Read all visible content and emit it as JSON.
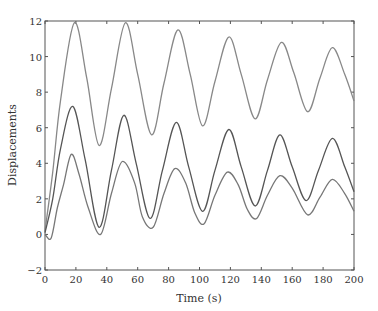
{
  "chart_data": {
    "type": "line",
    "title": "",
    "xlabel": "Time (s)",
    "ylabel": "Displacements",
    "xlim": [
      0,
      200
    ],
    "ylim": [
      -2,
      12
    ],
    "xticks": [
      0,
      20,
      40,
      60,
      80,
      100,
      120,
      140,
      160,
      180,
      200
    ],
    "yticks": [
      -2,
      0,
      2,
      4,
      6,
      8,
      10,
      12
    ],
    "xtick_labels": [
      "0",
      "20",
      "40",
      "60",
      "80",
      "100",
      "120",
      "140",
      "160",
      "180",
      "200"
    ],
    "ytick_labels": [
      "−2",
      "0",
      "2",
      "4",
      "6",
      "8",
      "10",
      "12"
    ],
    "grid": false,
    "legend": "none",
    "series": [
      {
        "name": "upper",
        "color": "#888888",
        "x": [
          0,
          5,
          10,
          19,
          27,
          35,
          43,
          52,
          60,
          69,
          77,
          86,
          94,
          102,
          110,
          119,
          127,
          136,
          144,
          153,
          161,
          170,
          178,
          186,
          194,
          200
        ],
        "y": [
          0.2,
          3.5,
          7.5,
          11.9,
          8.8,
          5.0,
          8.2,
          11.9,
          9.0,
          5.6,
          8.5,
          11.5,
          9.0,
          6.1,
          8.6,
          11.1,
          9.0,
          6.5,
          8.7,
          10.8,
          9.1,
          6.9,
          8.8,
          10.5,
          9.0,
          7.5
        ]
      },
      {
        "name": "middle",
        "color": "#555555",
        "x": [
          0,
          5,
          10,
          18,
          26,
          35,
          43,
          51,
          59,
          68,
          76,
          85,
          93,
          102,
          110,
          119,
          127,
          136,
          144,
          152,
          160,
          169,
          177,
          186,
          194,
          200
        ],
        "y": [
          0.1,
          2.0,
          4.8,
          7.2,
          4.2,
          0.4,
          3.6,
          6.7,
          4.0,
          0.9,
          3.6,
          6.3,
          3.8,
          1.3,
          3.6,
          5.9,
          3.8,
          1.6,
          3.6,
          5.6,
          3.8,
          1.9,
          3.6,
          5.4,
          3.8,
          2.4
        ]
      },
      {
        "name": "lower",
        "color": "#777777",
        "x": [
          0,
          4,
          8,
          12,
          17,
          22,
          28,
          36,
          43,
          50,
          58,
          63,
          70,
          77,
          84,
          91,
          97,
          103,
          110,
          118,
          125,
          131,
          137,
          144,
          152,
          160,
          170,
          178,
          186,
          194,
          200
        ],
        "y": [
          0.0,
          -0.2,
          1.5,
          2.8,
          4.5,
          3.4,
          1.5,
          0.0,
          2.3,
          4.1,
          2.9,
          1.0,
          0.4,
          2.3,
          3.7,
          2.9,
          1.2,
          0.6,
          2.2,
          3.5,
          2.8,
          1.4,
          0.9,
          2.2,
          3.3,
          2.6,
          1.1,
          2.1,
          3.1,
          2.3,
          1.3
        ]
      }
    ]
  }
}
